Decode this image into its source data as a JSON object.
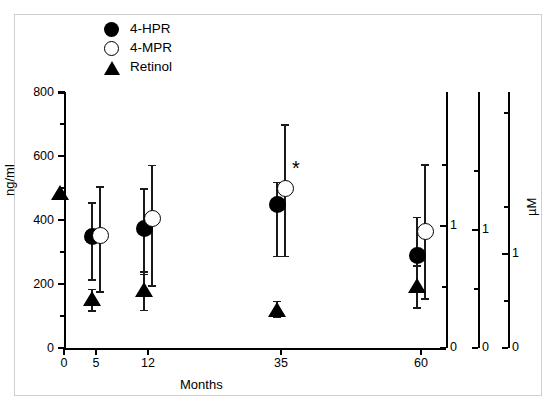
{
  "figure": {
    "background": "#ffffff",
    "frame_color": "#cfcfcf",
    "marker_color": "#000000"
  },
  "legend": {
    "position": "top-center",
    "items": [
      {
        "label": "4-HPR",
        "marker": "filled-circle-icon"
      },
      {
        "label": "4-MPR",
        "marker": "open-circle-icon"
      },
      {
        "label": "Retinol",
        "marker": "filled-triangle-icon"
      }
    ]
  },
  "axes": {
    "y_title": "ng/ml",
    "x_title": "Months",
    "right_title": "µM",
    "y_ticks": [
      "0",
      "200",
      "400",
      "600",
      "800"
    ],
    "x_ticks": [
      "0",
      "5",
      "12",
      "35",
      "60"
    ],
    "right_ticks": [
      "0",
      "1"
    ]
  },
  "annotations": [
    {
      "text": "*",
      "x_months": 35,
      "note": "significance marker beside 4-MPR at 35 months"
    }
  ],
  "chart_data": {
    "type": "scatter",
    "title": "",
    "xlabel": "Months",
    "ylabel": "ng/ml",
    "secondary_ylabel": "µM",
    "xlim": [
      0,
      65
    ],
    "ylim": [
      0,
      800
    ],
    "grid": false,
    "legend_position": "top-center",
    "x": [
      0,
      5,
      12,
      35,
      60
    ],
    "xtick_labels": [
      "0",
      "5",
      "12",
      "35",
      "60"
    ],
    "ytick_labels": [
      "0",
      "200",
      "400",
      "600",
      "800"
    ],
    "series": [
      {
        "name": "4-HPR",
        "marker": "filled-circle",
        "points": [
          {
            "x": 5,
            "y": 350,
            "lo": 215,
            "hi": 455
          },
          {
            "x": 12,
            "y": 375,
            "lo": 232,
            "hi": 500
          },
          {
            "x": 35,
            "y": 448,
            "lo": 288,
            "hi": 520
          },
          {
            "x": 60,
            "y": 288,
            "lo": 185,
            "hi": 410
          }
        ]
      },
      {
        "name": "4-MPR",
        "marker": "open-circle",
        "points": [
          {
            "x": 5,
            "y": 352,
            "lo": 178,
            "hi": 505
          },
          {
            "x": 12,
            "y": 405,
            "lo": 196,
            "hi": 572
          },
          {
            "x": 35,
            "y": 497,
            "lo": 288,
            "hi": 700
          },
          {
            "x": 60,
            "y": 365,
            "lo": 155,
            "hi": 575
          }
        ]
      },
      {
        "name": "Retinol",
        "marker": "filled-triangle",
        "points": [
          {
            "x": 0,
            "y": 485,
            "lo": null,
            "hi": null
          },
          {
            "x": 5,
            "y": 152,
            "lo": 118,
            "hi": 185
          },
          {
            "x": 12,
            "y": 180,
            "lo": 120,
            "hi": 240
          },
          {
            "x": 35,
            "y": 120,
            "lo": 100,
            "hi": 148
          },
          {
            "x": 60,
            "y": 193,
            "lo": 128,
            "hi": 258
          }
        ]
      }
    ],
    "right_axes": [
      {
        "for_series": "4-HPR",
        "ticks": [
          0,
          1
        ]
      },
      {
        "for_series": "4-MPR",
        "ticks": [
          0,
          1
        ]
      },
      {
        "for_series": "Retinol",
        "ticks": [
          0,
          1
        ]
      }
    ]
  }
}
